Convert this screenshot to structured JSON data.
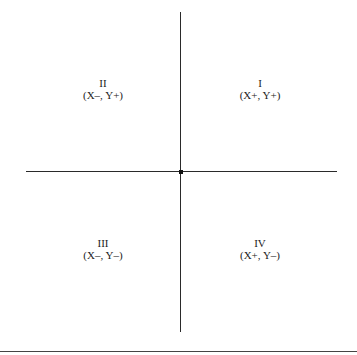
{
  "diagram": {
    "quadrants": [
      {
        "id": "I",
        "numeral": "I",
        "signs": "(X+, Y+)"
      },
      {
        "id": "II",
        "numeral": "II",
        "signs": "(X–, Y+)"
      },
      {
        "id": "III",
        "numeral": "III",
        "signs": "(X–, Y–)"
      },
      {
        "id": "IV",
        "numeral": "IV",
        "signs": "(X+, Y–)"
      }
    ]
  }
}
